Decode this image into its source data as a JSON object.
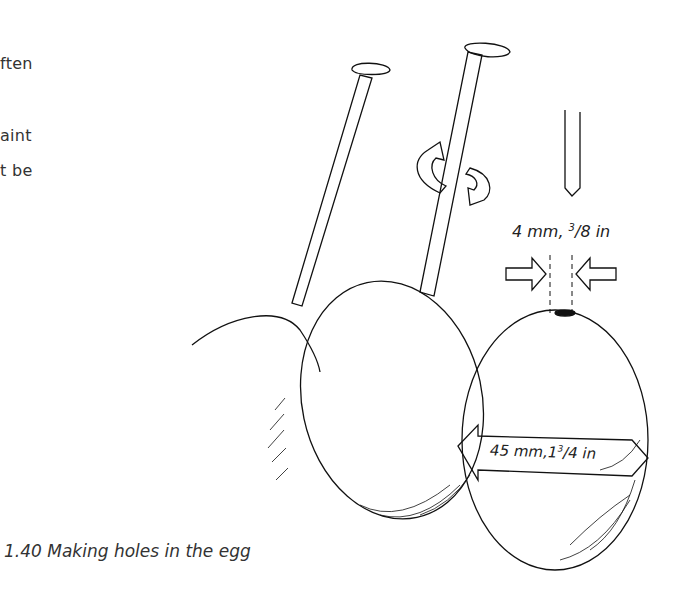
{
  "body_text": {
    "lines": [
      "ften",
      "",
      "aint",
      "t  be"
    ]
  },
  "figure": {
    "caption": "1.40 Making holes in the egg",
    "labels": {
      "hole_diameter": "4 mm, 3/8 in",
      "hole_diameter_mm": "4 mm, ",
      "hole_diameter_in_sup": "3",
      "hole_diameter_in_rest": "/8 in",
      "egg_width_mm": "45 mm,",
      "egg_width_in_whole": "1",
      "egg_width_in_sup": "3",
      "egg_width_in_rest": "/4 in"
    },
    "elements": [
      "nail-1",
      "nail-2-rotating",
      "rotation-arrows",
      "drill-bit",
      "egg-back",
      "egg-middle",
      "egg-front",
      "diameter-arrows",
      "width-arrow"
    ]
  }
}
